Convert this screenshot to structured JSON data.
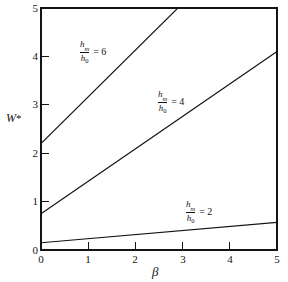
{
  "figure": {
    "background_color": "#ffffff",
    "line_color": "#141414",
    "axis_color": "#141414"
  },
  "axes": {
    "x_title": "β",
    "y_title_base": "W",
    "y_title_star": "*",
    "x_ticks": [
      "0",
      "1",
      "2",
      "3",
      "4",
      "5"
    ],
    "y_ticks": [
      "0",
      "1",
      "2",
      "3",
      "4",
      "5"
    ]
  },
  "annotations": {
    "curve6": {
      "numerator": "h",
      "num_sub": "m",
      "denominator": "h",
      "den_sub": "0",
      "equals": "= 6"
    },
    "curve4": {
      "numerator": "h",
      "num_sub": "m",
      "denominator": "h",
      "den_sub": "0",
      "equals": "= 4"
    },
    "curve2": {
      "numerator": "h",
      "num_sub": "m",
      "denominator": "h",
      "den_sub": "0",
      "equals": "= 2"
    }
  },
  "chart_data": {
    "type": "line",
    "title": "",
    "xlabel": "β",
    "ylabel": "W*",
    "xlim": [
      0,
      5
    ],
    "ylim": [
      0,
      5
    ],
    "xticks": [
      0,
      1,
      2,
      3,
      4,
      5
    ],
    "yticks": [
      0,
      1,
      2,
      3,
      4,
      5
    ],
    "grid": false,
    "legend": "inline-curve-labels",
    "x": [
      0,
      5
    ],
    "series": [
      {
        "name": "hm/h0 = 6",
        "label": "h_m/h_0 = 6",
        "intercept": 2.2,
        "slope": 0.966,
        "x": [
          0,
          2.9
        ],
        "values": [
          2.2,
          5.0
        ],
        "clipped_at_top": true
      },
      {
        "name": "hm/h0 = 4",
        "label": "h_m/h_0 = 4",
        "intercept": 0.75,
        "slope": 0.67,
        "x": [
          0,
          5
        ],
        "values": [
          0.75,
          4.1
        ],
        "clipped_at_top": false
      },
      {
        "name": "hm/h0 = 2",
        "label": "h_m/h_0 = 2",
        "intercept": 0.15,
        "slope": 0.084,
        "x": [
          0,
          5
        ],
        "values": [
          0.15,
          0.57
        ],
        "clipped_at_top": false
      }
    ]
  }
}
